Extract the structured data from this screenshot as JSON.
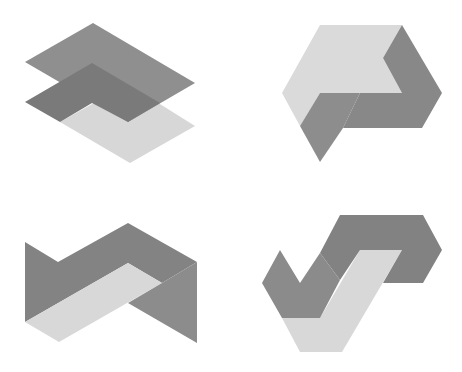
{
  "figure": {
    "background": "#ffffff",
    "width": 462,
    "height": 372,
    "colors": {
      "light": "#d7d7d7",
      "medium": "#8f8f8f",
      "dark": "#7a7a7a",
      "mid_a": "#868686",
      "mid_b": "#8c8c8c"
    },
    "shapes": [
      {
        "id": "stacked-planes",
        "position": "top-left",
        "polygons": [
          {
            "role": "light-plane",
            "color": "#d7d7d7",
            "points": "60,122 128,84 195,126 130,163"
          },
          {
            "role": "top-plane",
            "color": "#8f8f8f",
            "points": "25,62 93,23 195,83 128,122"
          },
          {
            "role": "middle-chevron",
            "color": "#7a7a7a",
            "points": "25,102 92,63 160,103 128,122 92,103 60,122"
          }
        ]
      },
      {
        "id": "impossible-p",
        "position": "top-right",
        "polygons": [
          {
            "role": "light-face",
            "color": "#dadada",
            "points": "320,25 402,25 383,58 402,93 320,93 300,126 282,93"
          },
          {
            "role": "right-face",
            "color": "#888888",
            "points": "402,25 442,93 422,128 343,128 360,93 402,93 383,58"
          },
          {
            "role": "left-face",
            "color": "#8d8d8d",
            "points": "320,93 360,93 343,128 320,162 300,126"
          }
        ]
      },
      {
        "id": "zigzag-band",
        "position": "bottom-left",
        "polygons": [
          {
            "role": "dark-band",
            "color": "#838383",
            "points": "25,242 58,262 128,223 197,262 162,283 128,263 25,322"
          },
          {
            "role": "light-band",
            "color": "#d8d8d8",
            "points": "128,263 162,283 59,342 25,322"
          },
          {
            "role": "right-face",
            "color": "#8c8c8c",
            "points": "197,262 197,343 128,303 162,283"
          }
        ]
      },
      {
        "id": "impossible-s",
        "position": "bottom-right",
        "polygons": [
          {
            "role": "light-face",
            "color": "#d8d8d8",
            "points": "360,250 402,250 342,352 300,352 282,318 320,318"
          },
          {
            "role": "top-band",
            "color": "#828282",
            "points": "340,215 423,215 442,250 423,283 383,283 402,250 360,250 340,280 320,253"
          },
          {
            "role": "v-face",
            "color": "#8b8b8b",
            "points": "280,250 300,283 320,253 340,280 320,318 282,318 262,283"
          }
        ]
      }
    ]
  }
}
